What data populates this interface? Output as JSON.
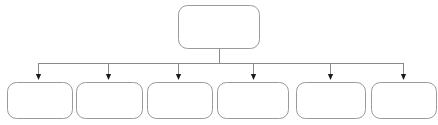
{
  "diagram": {
    "type": "tree-hierarchy",
    "title": "",
    "orientation": "top-down",
    "background_color": "#ffffff",
    "box_border_color": "#9a9a9a",
    "box_fill_color": "#ffffff",
    "connector_color": "#8a8a8a",
    "arrow_color": "#1a1a1a",
    "box_border_width": 1,
    "box_corner_radius": 9,
    "levels": 2,
    "parent": {
      "id": "parent-node",
      "label": "",
      "x": 178,
      "y": 5,
      "width": 81,
      "height": 43
    },
    "bus": {
      "stem_x": 219,
      "stem_top": 48,
      "stem_bottom": 63,
      "line_y": 63,
      "line_left": 38,
      "line_right": 403
    },
    "arrows": [
      {
        "id": "arrow-1",
        "x": 38,
        "top": 63,
        "tip": 80
      },
      {
        "id": "arrow-2",
        "x": 108,
        "top": 63,
        "tip": 80
      },
      {
        "id": "arrow-3",
        "x": 178,
        "top": 63,
        "tip": 80
      },
      {
        "id": "arrow-4",
        "x": 253,
        "top": 63,
        "tip": 80
      },
      {
        "id": "arrow-5",
        "x": 330,
        "top": 63,
        "tip": 80
      },
      {
        "id": "arrow-6",
        "x": 403,
        "top": 63,
        "tip": 80
      }
    ],
    "children": [
      {
        "id": "child-node-1",
        "label": "",
        "x": 7,
        "y": 82,
        "width": 65,
        "height": 36
      },
      {
        "id": "child-node-2",
        "label": "",
        "x": 76,
        "y": 82,
        "width": 66,
        "height": 36
      },
      {
        "id": "child-node-3",
        "label": "",
        "x": 147,
        "y": 82,
        "width": 65,
        "height": 36
      },
      {
        "id": "child-node-4",
        "label": "",
        "x": 217,
        "y": 82,
        "width": 71,
        "height": 36
      },
      {
        "id": "child-node-5",
        "label": "",
        "x": 296,
        "y": 82,
        "width": 69,
        "height": 36
      },
      {
        "id": "child-node-6",
        "label": "",
        "x": 371,
        "y": 82,
        "width": 65,
        "height": 36
      }
    ]
  }
}
